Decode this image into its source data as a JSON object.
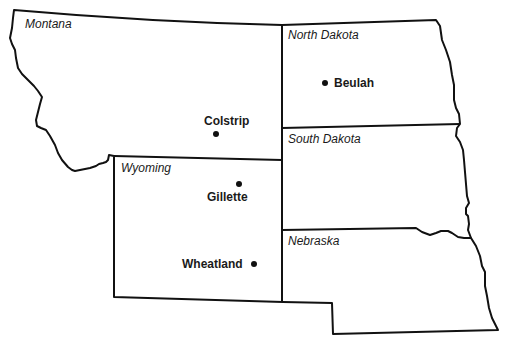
{
  "map": {
    "states": [
      {
        "id": "montana",
        "label": "Montana"
      },
      {
        "id": "north-dakota",
        "label": "North Dakota"
      },
      {
        "id": "south-dakota",
        "label": "South Dakota"
      },
      {
        "id": "wyoming",
        "label": "Wyoming"
      },
      {
        "id": "nebraska",
        "label": "Nebraska"
      }
    ],
    "cities": [
      {
        "id": "colstrip",
        "label": "Colstrip",
        "state": "Montana"
      },
      {
        "id": "beulah",
        "label": "Beulah",
        "state": "North Dakota"
      },
      {
        "id": "gillette",
        "label": "Gillette",
        "state": "Wyoming"
      },
      {
        "id": "wheatland",
        "label": "Wheatland",
        "state": "Wyoming"
      }
    ],
    "colors": {
      "line": "#111111",
      "background": "#ffffff"
    }
  }
}
